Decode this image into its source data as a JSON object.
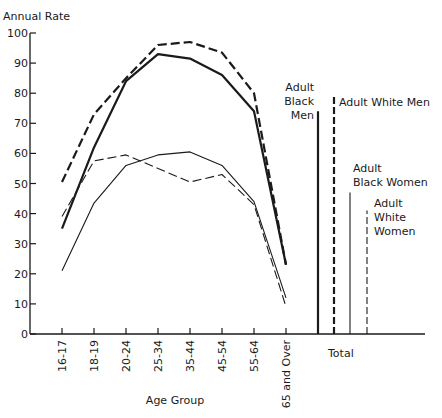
{
  "chart_data": {
    "type": "line",
    "title": "",
    "ylabel": "Annual Rate",
    "xlabel": "Age Group",
    "ylim": [
      0,
      100
    ],
    "yticks": [
      0,
      10,
      20,
      30,
      40,
      50,
      60,
      70,
      80,
      90,
      100
    ],
    "grid": false,
    "categories": [
      "16-17",
      "18-19",
      "20-24",
      "25-34",
      "35-44",
      "45-54",
      "55-64",
      "65 and Over"
    ],
    "series": [
      {
        "name": "Adult Black Men",
        "style": "thick-solid",
        "values": [
          35,
          62,
          84,
          93,
          91.5,
          86,
          74,
          23
        ]
      },
      {
        "name": "Adult White Men",
        "style": "thick-dashed",
        "values": [
          50.5,
          73,
          85,
          96,
          97,
          93.5,
          80,
          23
        ]
      },
      {
        "name": "Adult Black Women",
        "style": "thin-solid",
        "values": [
          21,
          43.5,
          56,
          59.5,
          60.5,
          56,
          44,
          12
        ]
      },
      {
        "name": "Adult White Women",
        "style": "thin-dashed",
        "values": [
          39,
          57.5,
          59.5,
          55,
          50.5,
          53,
          43,
          9
        ]
      }
    ],
    "totals": {
      "label": "Total",
      "bars": [
        {
          "name": "Adult Black Men",
          "label_lines": [
            "Adult",
            "Black",
            "Men"
          ],
          "style": "thick-solid",
          "value": 74
        },
        {
          "name": "Adult White Men",
          "label_lines": [
            "Adult White Men"
          ],
          "style": "thick-dashed",
          "value": 79
        },
        {
          "name": "Adult Black Women",
          "label_lines": [
            "Adult",
            "Black Women"
          ],
          "style": "thin-solid",
          "value": 47
        },
        {
          "name": "Adult White Women",
          "label_lines": [
            "Adult",
            "White",
            "Women"
          ],
          "style": "thin-dashed",
          "value": 41
        }
      ]
    }
  }
}
